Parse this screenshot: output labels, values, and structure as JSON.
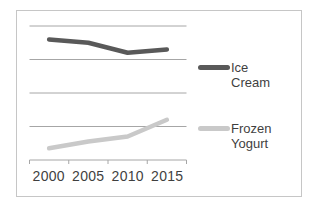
{
  "chart_data": {
    "type": "line",
    "categories": [
      "2000",
      "2005",
      "2010",
      "2015"
    ],
    "series": [
      {
        "name": "Ice Cream",
        "color": "#595959",
        "values": [
          3.6,
          3.5,
          3.2,
          3.3
        ]
      },
      {
        "name": "Frozen Yogurt",
        "color": "#c9c9c9",
        "values": [
          0.35,
          0.55,
          0.7,
          1.2
        ]
      }
    ],
    "title": "",
    "xlabel": "",
    "ylabel": "",
    "ylim": [
      0,
      4
    ],
    "ytick_step": 1,
    "gridlines": true,
    "gridline_color": "#a6a6a6",
    "axis_color": "#a6a6a6",
    "legend_position": "right",
    "frame_border_color": "#c6c6c6",
    "background_color": "#ffffff",
    "text_color": "#3f3f3f"
  }
}
